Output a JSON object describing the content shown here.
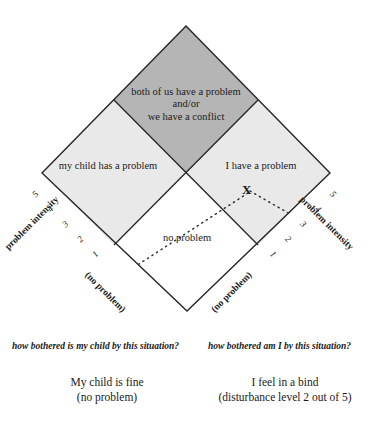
{
  "diagram": {
    "type": "problem-ownership-diamond",
    "quadrants": {
      "top": {
        "label_line1": "both of us have a problem",
        "label_line2": "and/or",
        "label_line3": "we have a conflict",
        "fill": "#b5b5b5"
      },
      "left": {
        "label": "my child has a problem",
        "fill": "#e9e9e9"
      },
      "right": {
        "label": "I have a problem",
        "fill": "#e9e9e9"
      },
      "bottom": {
        "label": "no problem",
        "fill": "#ffffff"
      }
    },
    "marker": {
      "symbol": "X"
    },
    "outline_color": "#262626"
  },
  "axes": {
    "left": {
      "title": "problem intensity",
      "ticks": [
        "5",
        "4",
        "3",
        "2",
        "1"
      ],
      "origin_label": "(no problem)"
    },
    "right": {
      "title": "problem intensity",
      "ticks": [
        "1",
        "2",
        "3",
        "4",
        "5"
      ],
      "origin_label": "(no problem)"
    }
  },
  "captions": {
    "left": "how bothered is my child by this situation?",
    "right": "how bothered am I by this situation?"
  },
  "conclusions": {
    "left_line1": "My child is fine",
    "left_line2": "(no problem)",
    "right_line1": "I feel in a bind",
    "right_line2": "(disturbance level 2 out of 5)"
  }
}
